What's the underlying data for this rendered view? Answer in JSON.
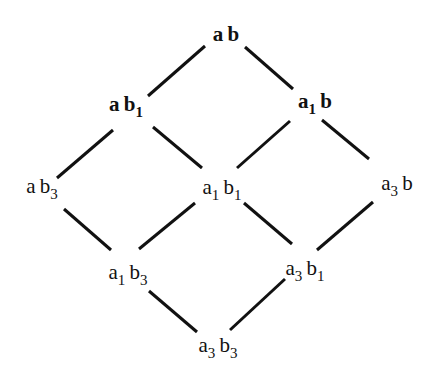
{
  "diagram": {
    "type": "lattice",
    "nodes": [
      {
        "id": "ab",
        "base1": "a",
        "sub1": "",
        "base2": "b",
        "sub2": "",
        "x": 226,
        "y": 34,
        "bold": true
      },
      {
        "id": "ab1",
        "base1": "a",
        "sub1": "",
        "base2": "b",
        "sub2": "1",
        "x": 126,
        "y": 107,
        "bold": true
      },
      {
        "id": "a1b",
        "base1": "a",
        "sub1": "1",
        "base2": "b",
        "sub2": "",
        "x": 315,
        "y": 104,
        "bold": true
      },
      {
        "id": "ab3",
        "base1": "a",
        "sub1": "",
        "base2": "b",
        "sub2": "3",
        "x": 42,
        "y": 189,
        "bold": false
      },
      {
        "id": "a1b1",
        "base1": "a",
        "sub1": "1",
        "base2": "b",
        "sub2": "1",
        "x": 222,
        "y": 190,
        "bold": false
      },
      {
        "id": "a3b",
        "base1": "a",
        "sub1": "3",
        "base2": "b",
        "sub2": "",
        "x": 397,
        "y": 186,
        "bold": false
      },
      {
        "id": "a1b3",
        "base1": "a",
        "sub1": "1",
        "base2": "b",
        "sub2": "3",
        "x": 128,
        "y": 275,
        "bold": false
      },
      {
        "id": "a3b1",
        "base1": "a",
        "sub1": "3",
        "base2": "b",
        "sub2": "1",
        "x": 305,
        "y": 271,
        "bold": false
      },
      {
        "id": "a3b3",
        "base1": "a",
        "sub1": "3",
        "base2": "b",
        "sub2": "3",
        "x": 218,
        "y": 348,
        "bold": false
      }
    ],
    "edges": [
      {
        "from": "ab",
        "to": "ab1",
        "x1": 205,
        "y1": 46,
        "x2": 148,
        "y2": 96
      },
      {
        "from": "ab",
        "to": "a1b",
        "x1": 245,
        "y1": 47,
        "x2": 293,
        "y2": 89
      },
      {
        "from": "ab1",
        "to": "ab3",
        "x1": 113,
        "y1": 130,
        "x2": 57,
        "y2": 178
      },
      {
        "from": "ab1",
        "to": "a1b1",
        "x1": 153,
        "y1": 127,
        "x2": 202,
        "y2": 168
      },
      {
        "from": "a1b",
        "to": "a1b1",
        "x1": 290,
        "y1": 121,
        "x2": 237,
        "y2": 168
      },
      {
        "from": "a1b",
        "to": "a3b",
        "x1": 322,
        "y1": 120,
        "x2": 369,
        "y2": 159
      },
      {
        "from": "ab3",
        "to": "a1b3",
        "x1": 64,
        "y1": 209,
        "x2": 111,
        "y2": 250
      },
      {
        "from": "a1b1",
        "to": "a1b3",
        "x1": 195,
        "y1": 203,
        "x2": 139,
        "y2": 249
      },
      {
        "from": "a1b1",
        "to": "a3b1",
        "x1": 244,
        "y1": 203,
        "x2": 292,
        "y2": 244
      },
      {
        "from": "a3b",
        "to": "a3b1",
        "x1": 373,
        "y1": 202,
        "x2": 317,
        "y2": 250
      },
      {
        "from": "a1b3",
        "to": "a3b3",
        "x1": 149,
        "y1": 291,
        "x2": 197,
        "y2": 332
      },
      {
        "from": "a3b1",
        "to": "a3b3",
        "x1": 285,
        "y1": 279,
        "x2": 230,
        "y2": 330
      }
    ],
    "line_color": "#111111",
    "line_width": 3
  }
}
